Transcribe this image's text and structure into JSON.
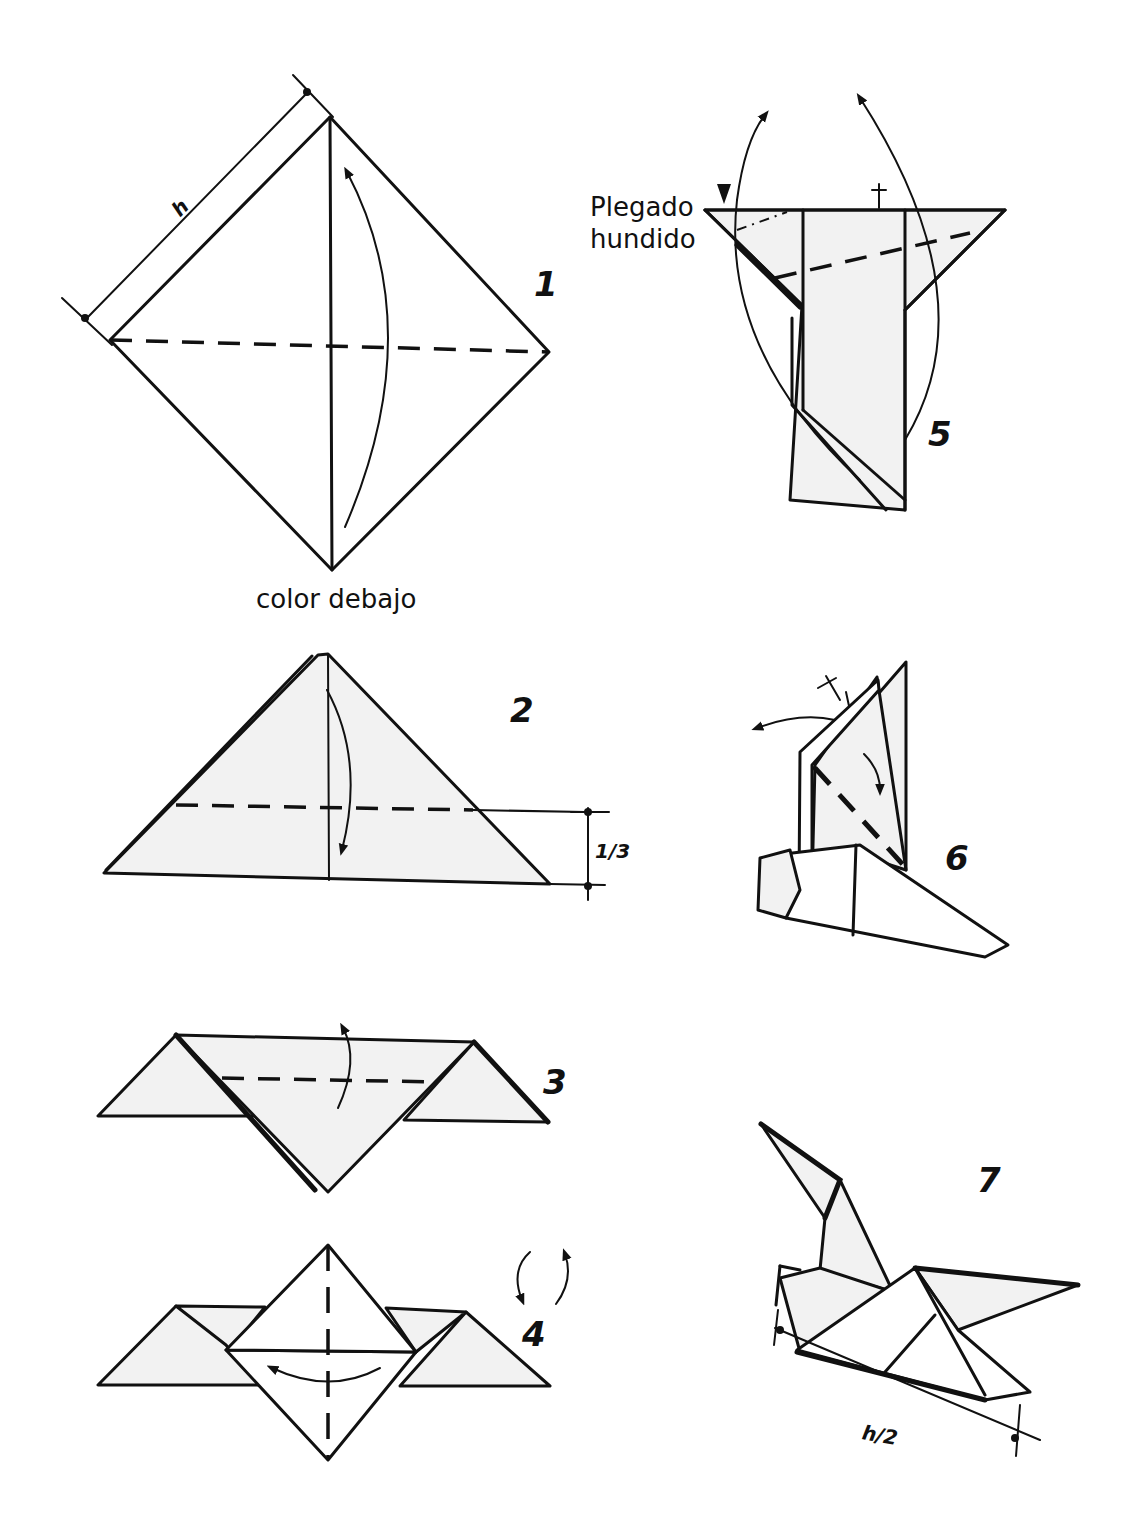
{
  "diagram": {
    "type": "origami-instructions",
    "steps": [
      {
        "number": "1",
        "label": "color debajo",
        "dimension": "h",
        "description": "Square diamond with vertical crease, horizontal valley fold line, fold bottom up"
      },
      {
        "number": "2",
        "dimension": "1/3",
        "description": "Triangle, fold top down along dashed line at 1/3 height"
      },
      {
        "number": "3",
        "description": "Valley fold along dashed line"
      },
      {
        "number": "4",
        "description": "Valley fold along vertical center line, turn over"
      },
      {
        "number": "5",
        "label_line1": "Plegado",
        "label_line2": "hundido",
        "description": "Inside-reverse (sink) fold and fold flaps up"
      },
      {
        "number": "6",
        "description": "Fold wing down along dashed line"
      },
      {
        "number": "7",
        "dimension": "h/2",
        "description": "Finished bird model"
      }
    ]
  }
}
